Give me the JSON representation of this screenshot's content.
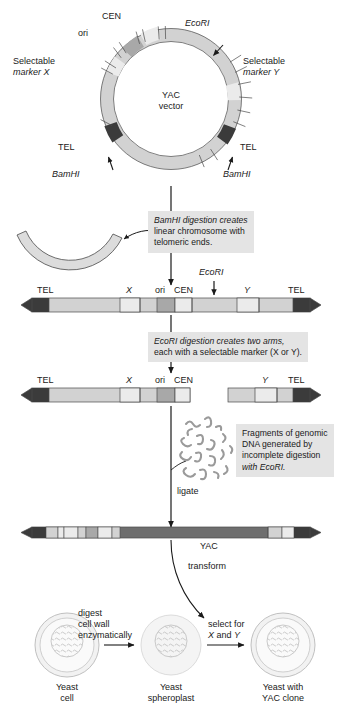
{
  "figure": {
    "colors": {
      "background": "#ffffff",
      "vector_backbone": "#d2d2d2",
      "backbone_light": "#dcdcdc",
      "telomere_dark": "#3b3b3b",
      "ori_medium": "#a8a8a8",
      "marker_light": "#ebebeb",
      "insert_dark": "#6e6e6e",
      "note_bg": "#e4e4e4",
      "stroke": "#4a4a4a",
      "dna_squiggle": "#9a9a9a",
      "cell_wall": "#c9c9c9",
      "cell_fill": "#f2f2f2"
    }
  },
  "vector": {
    "center_line1": "YAC",
    "center_line2": "vector",
    "labels": {
      "cen": "CEN",
      "ori": "ori",
      "ecori": "EcoRI",
      "marker_x_line1": "Selectable",
      "marker_x_line2": "marker X",
      "marker_y_line1": "Selectable",
      "marker_y_line2": "marker Y",
      "tel_left": "TEL",
      "tel_right": "TEL",
      "bamhi_left": "BamHI",
      "bamhi_right": "BamHI"
    }
  },
  "steps": {
    "bamhi_note_line1": "BamHI digestion creates",
    "bamhi_note_line2": "linear chromosome with",
    "bamhi_note_line3": "telomeric ends.",
    "ecori_note_line1": "EcoRI digestion creates two arms,",
    "ecori_note_line2": "each with a selectable marker (X or Y).",
    "fragments_note_line1": "Fragments of genomic",
    "fragments_note_line2": "DNA generated by",
    "fragments_note_line3": "incomplete digestion",
    "fragments_note_line4": "with EcoRI.",
    "ligate_label": "ligate",
    "transform_label": "transform"
  },
  "linear_chromosome": {
    "tel_left": "TEL",
    "marker_x": "X",
    "ori": "ori",
    "cen": "CEN",
    "ecori": "EcoRI",
    "marker_y": "Y",
    "tel_right": "TEL"
  },
  "arms": {
    "left": {
      "tel": "TEL",
      "marker_x": "X",
      "ori": "ori",
      "cen": "CEN"
    },
    "right": {
      "marker_y": "Y",
      "tel": "TEL"
    }
  },
  "yac": {
    "label": "YAC"
  },
  "cells": {
    "arrow1_line1": "digest",
    "arrow1_line2": "cell wall",
    "arrow1_line3": "enzymatically",
    "arrow2_line1": "select for",
    "arrow2_line2": "X and Y",
    "cell1_line1": "Yeast",
    "cell1_line2": "cell",
    "cell2_line1": "Yeast",
    "cell2_line2": "spheroplast",
    "cell3_line1": "Yeast with",
    "cell3_line2": "YAC clone"
  }
}
